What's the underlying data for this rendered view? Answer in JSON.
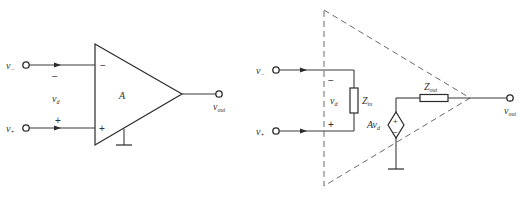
{
  "diagram": {
    "title": "",
    "left_symbol": {
      "name": "op-amp-symbol",
      "inputs": [
        {
          "id": "inverting",
          "label_main": "v",
          "label_sub": "−",
          "pin_sign": "−"
        },
        {
          "id": "noninverting",
          "label_main": "v",
          "label_sub": "+",
          "pin_sign": "+"
        }
      ],
      "diff_voltage": {
        "label_main": "v",
        "label_sub": "d",
        "top_sign": "−",
        "bottom_sign": "+"
      },
      "gain_label": "A",
      "output": {
        "label_main": "v",
        "label_sub": "out"
      }
    },
    "right_model": {
      "name": "op-amp-equivalent-circuit",
      "inputs": [
        {
          "id": "inverting",
          "label_main": "v",
          "label_sub": "−"
        },
        {
          "id": "noninverting",
          "label_main": "v",
          "label_sub": "+"
        }
      ],
      "diff_voltage": {
        "label_main": "v",
        "label_sub": "d",
        "top_sign": "−",
        "bottom_sign": "+"
      },
      "input_impedance": {
        "label_main": "Z",
        "label_sub": "in"
      },
      "dependent_source": {
        "label_main": "Av",
        "label_sub": "d",
        "top_sign": "+",
        "bottom_sign": "−"
      },
      "output_impedance": {
        "label_main": "Z",
        "label_sub": "out"
      },
      "output": {
        "label_main": "v",
        "label_sub": "out"
      }
    },
    "colors": {
      "line": "#2a2a2a",
      "dashed": "#6a6a6a",
      "text": "#333333",
      "background": "#ffffff"
    }
  }
}
